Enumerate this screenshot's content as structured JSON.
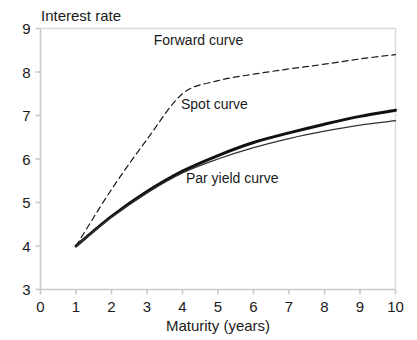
{
  "chart_data": {
    "type": "line",
    "title": "",
    "ylabel": "Interest rate",
    "xlabel": "Maturity (years)",
    "xlim": [
      0,
      10
    ],
    "ylim": [
      3,
      9
    ],
    "xticks": [
      "0",
      "1",
      "2",
      "3",
      "4",
      "5",
      "6",
      "7",
      "8",
      "9",
      "10"
    ],
    "yticks": [
      "3",
      "4",
      "5",
      "6",
      "7",
      "8",
      "9"
    ],
    "grid": false,
    "legend_position": "inline-annotations",
    "x": [
      1,
      2,
      3,
      4,
      5,
      6,
      7,
      8,
      9,
      10
    ],
    "series": [
      {
        "name": "Forward curve",
        "style": "dashed",
        "width": 1.2,
        "color": "#1a1a1a",
        "values": [
          4.0,
          5.3,
          6.45,
          7.5,
          7.8,
          7.95,
          8.07,
          8.18,
          8.3,
          8.4
        ]
      },
      {
        "name": "Spot curve",
        "style": "solid",
        "width": 3.0,
        "color": "#111111",
        "values": [
          4.0,
          4.68,
          5.25,
          5.72,
          6.08,
          6.38,
          6.6,
          6.8,
          6.98,
          7.12
        ]
      },
      {
        "name": "Par yield curve",
        "style": "solid",
        "width": 1.3,
        "color": "#333333",
        "values": [
          4.0,
          4.66,
          5.22,
          5.68,
          6.0,
          6.26,
          6.47,
          6.64,
          6.78,
          6.88
        ]
      }
    ],
    "annotations": [
      {
        "text": "Forward curve",
        "x": 4.45,
        "y": 8.62
      },
      {
        "text": "Spot curve",
        "x": 4.9,
        "y": 7.15
      },
      {
        "text": "Par yield curve",
        "x": 5.4,
        "y": 5.45
      }
    ],
    "axis_color": "#c9c9c9",
    "text_color": "#1a1a1a",
    "background": "#ffffff"
  }
}
